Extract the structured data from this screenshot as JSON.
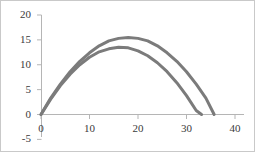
{
  "chart_data": {
    "type": "line",
    "title": "",
    "xlabel": "",
    "ylabel": "",
    "xlim": [
      0,
      40
    ],
    "ylim": [
      -5,
      20
    ],
    "grid": false,
    "legend": null,
    "x_ticks": [
      "0",
      "10",
      "20",
      "30",
      "40"
    ],
    "x_tick_values": [
      0,
      10,
      20,
      30,
      40
    ],
    "y_ticks": [
      "20",
      "15",
      "10",
      "5",
      "0",
      "-5"
    ],
    "y_tick_values": [
      20,
      15,
      10,
      5,
      0,
      -5
    ],
    "series": [
      {
        "name": "trajectory-outer",
        "color": "#7b7b7b",
        "peak_x": 18,
        "peak_y": 15.5,
        "x_start": 0,
        "x_end": 35.7,
        "x": [
          0,
          2,
          4,
          6,
          8,
          10,
          12,
          14,
          16,
          18,
          20,
          22,
          24,
          26,
          28,
          30,
          32,
          34,
          35.7
        ],
        "values": [
          0,
          3.3,
          6.1,
          8.6,
          10.7,
          12.4,
          13.8,
          14.8,
          15.3,
          15.5,
          15.3,
          14.8,
          13.8,
          12.4,
          10.7,
          8.6,
          6.1,
          3.3,
          0
        ]
      },
      {
        "name": "trajectory-inner",
        "color": "#7b7b7b",
        "peak_x": 16.6,
        "peak_y": 13.5,
        "x_start": 0,
        "x_end": 33.1,
        "x": [
          0,
          2,
          4,
          6,
          8,
          10,
          12,
          14,
          16,
          18,
          20,
          22,
          24,
          26,
          28,
          30,
          32,
          33.1
        ],
        "values": [
          0,
          3.1,
          5.8,
          8.1,
          10.0,
          11.5,
          12.6,
          13.2,
          13.5,
          13.4,
          12.8,
          11.8,
          10.4,
          8.6,
          6.4,
          3.8,
          0.8,
          0
        ]
      }
    ]
  }
}
